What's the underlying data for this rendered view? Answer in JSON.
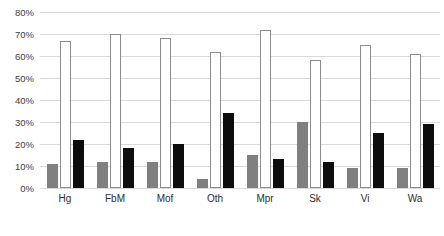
{
  "chart_data": {
    "type": "bar",
    "title": "",
    "xlabel": "",
    "ylabel": "",
    "ylim": [
      0,
      80
    ],
    "ytick_step": 10,
    "grid": true,
    "legend_position": "none",
    "categories": [
      "Hg",
      "FbM",
      "Mof",
      "Oth",
      "Mpr",
      "Sk",
      "Vi",
      "Wa"
    ],
    "ytick_labels": [
      "80%",
      "70%",
      "60%",
      "50%",
      "40%",
      "30%",
      "20%",
      "10%",
      "0%"
    ],
    "ytick_values": [
      80,
      70,
      60,
      50,
      40,
      30,
      20,
      10,
      0
    ],
    "series": [
      {
        "name": "series-1",
        "color": "#808080",
        "values": [
          11,
          12,
          12,
          4,
          15,
          30,
          9,
          9
        ]
      },
      {
        "name": "series-2",
        "color": "#ffffff",
        "border_color": "#8c8c8c",
        "values": [
          67,
          70,
          68,
          62,
          72,
          58,
          65,
          61
        ]
      },
      {
        "name": "series-3",
        "color": "#0d0d0d",
        "values": [
          22,
          18,
          20,
          34,
          13,
          12,
          25,
          29
        ]
      }
    ]
  },
  "colors": {
    "background": "#ffffff",
    "gridline": "#d9d9d9",
    "tick_text": "#3d3d3d",
    "category_text": "#2e2e2e"
  }
}
